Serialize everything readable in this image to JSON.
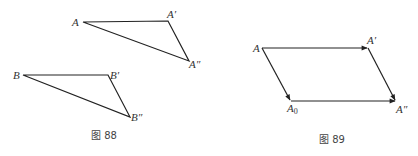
{
  "figures": [
    {
      "caption": "图 88",
      "triangles": [
        {
          "points": {
            "A": {
              "label": "A",
              "x": 83,
              "y": 22
            },
            "A1": {
              "label": "A′",
              "x": 168,
              "y": 21
            },
            "A2": {
              "label": "A″",
              "x": 189,
              "y": 61
            }
          }
        },
        {
          "points": {
            "B": {
              "label": "B",
              "x": 23,
              "y": 75
            },
            "B1": {
              "label": "B′",
              "x": 108,
              "y": 75
            },
            "B2": {
              "label": "B″",
              "x": 130,
              "y": 117
            }
          }
        }
      ]
    },
    {
      "caption": "图 89",
      "points": {
        "A": {
          "label": "A",
          "x": 262,
          "y": 48
        },
        "A1": {
          "label": "A′",
          "x": 368,
          "y": 48
        },
        "A0": {
          "label": "A",
          "sub": "0",
          "x": 291,
          "y": 101
        },
        "A2": {
          "label": "A″",
          "x": 396,
          "y": 101
        }
      },
      "vectors": [
        "A→A′",
        "A→A₀",
        "A₀→A″",
        "A′→A″"
      ]
    }
  ],
  "colors": {
    "line": "#222222",
    "text": "#333333",
    "background": "#ffffff"
  }
}
